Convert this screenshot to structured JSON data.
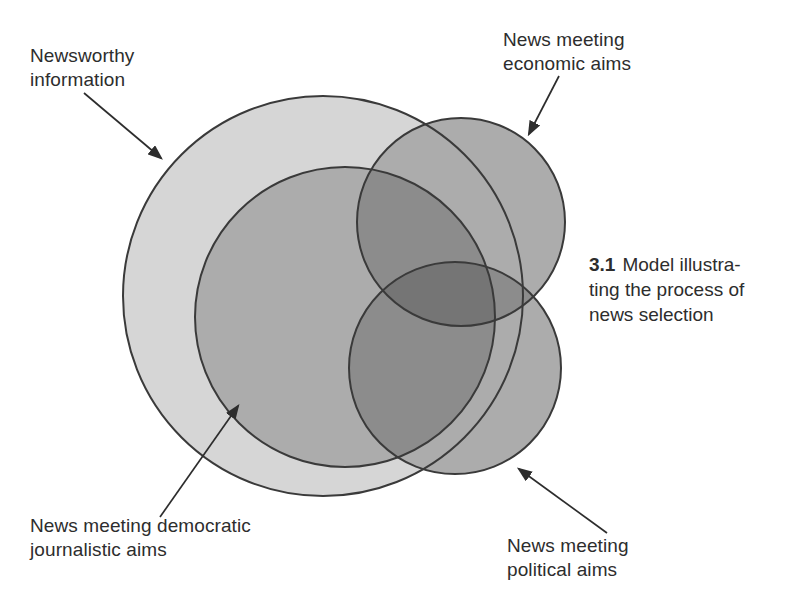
{
  "figure": {
    "caption": {
      "number": "3.1",
      "line1": "Model illustra-",
      "line2": "ting the process of",
      "line3": "news selection"
    },
    "labels": {
      "newsworthy": {
        "line1": "Newsworthy",
        "line2": "information"
      },
      "economic": {
        "line1": "News meeting",
        "line2": "economic aims"
      },
      "democratic": {
        "line1": "News meeting democratic",
        "line2": "journalistic aims"
      },
      "political": {
        "line1": "News meeting",
        "line2": "political aims"
      }
    },
    "colors": {
      "background": "#ffffff",
      "newsworthy_fill": "#d6d6d6",
      "single_aim_fill": "#acacac",
      "double_overlap_fill": "#8c8c8c",
      "triple_overlap_fill": "#757575",
      "outline": "#3a3a3a",
      "arrow": "#2d2d2d",
      "text": "#2d2d2d"
    }
  }
}
